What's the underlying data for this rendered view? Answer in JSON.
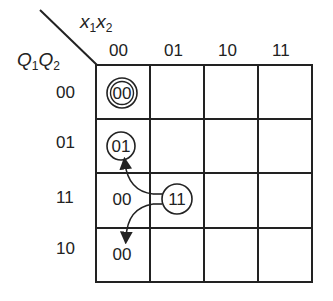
{
  "diagram": {
    "type": "karnaugh-map-state-table",
    "column_variable": {
      "base1": "x",
      "sub1": "1",
      "base2": "x",
      "sub2": "2"
    },
    "row_variable": {
      "base1": "Q",
      "sub1": "1",
      "base2": "Q",
      "sub2": "2"
    },
    "column_headers": [
      "00",
      "01",
      "10",
      "11"
    ],
    "row_headers": [
      "00",
      "01",
      "11",
      "10"
    ],
    "cells": [
      {
        "row": "00",
        "col": "00",
        "value": "00",
        "marker": "double-circle"
      },
      {
        "row": "01",
        "col": "00",
        "value": "01",
        "marker": "circle"
      },
      {
        "row": "11",
        "col": "00",
        "value": "00",
        "marker": "none"
      },
      {
        "row": "11",
        "col": "01",
        "value": "11",
        "marker": "circle"
      },
      {
        "row": "10",
        "col": "00",
        "value": "00",
        "marker": "none"
      }
    ],
    "arrows": [
      {
        "from": "cell 11/01 (11)",
        "to": "cell 01/00 (01)",
        "direction": "up"
      },
      {
        "from": "cell 11/01 (11)",
        "to": "cell 10/00",
        "direction": "down"
      }
    ],
    "line_color": "#222222",
    "background": "#ffffff"
  }
}
